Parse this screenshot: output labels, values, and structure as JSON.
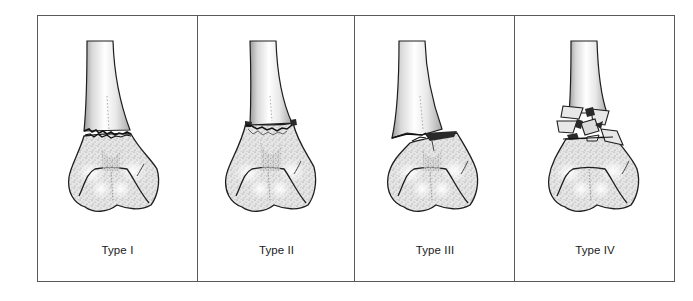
{
  "figure": {
    "panels": [
      {
        "id": "type-1",
        "label": "Type I"
      },
      {
        "id": "type-2",
        "label": "Type II"
      },
      {
        "id": "type-3",
        "label": "Type III"
      },
      {
        "id": "type-4",
        "label": "Type IV"
      }
    ]
  },
  "colors": {
    "border": "#5a5a5a",
    "bone_outline": "#1e1e1e",
    "bone_fill": "#eeeeee",
    "bone_shade": "#9a9a9a",
    "fracture_dark": "#2a2a2a",
    "label_text": "#1a1a1a"
  }
}
